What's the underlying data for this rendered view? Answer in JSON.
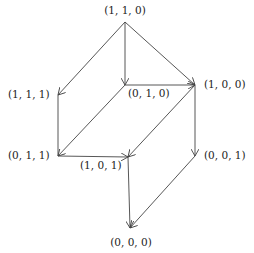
{
  "diagram": {
    "title": "",
    "nodes": [
      {
        "id": "n110",
        "label": "(1, 1, 0)",
        "x": 125,
        "y": 22,
        "lx": 125,
        "ly": 14,
        "anchor": "middle"
      },
      {
        "id": "n111",
        "label": "(1, 1, 1)",
        "x": 58,
        "y": 95,
        "lx": 8,
        "ly": 98,
        "anchor": "start"
      },
      {
        "id": "n010",
        "label": "(0, 1, 0)",
        "x": 125,
        "y": 85,
        "lx": 128,
        "ly": 97,
        "anchor": "start"
      },
      {
        "id": "n100",
        "label": "(1, 0, 0)",
        "x": 195,
        "y": 85,
        "lx": 204,
        "ly": 88,
        "anchor": "start"
      },
      {
        "id": "n011",
        "label": "(0, 1, 1)",
        "x": 58,
        "y": 156,
        "lx": 8,
        "ly": 159,
        "anchor": "start"
      },
      {
        "id": "n101",
        "label": "(1, 0, 1)",
        "x": 128,
        "y": 157,
        "lx": 80,
        "ly": 169,
        "anchor": "start"
      },
      {
        "id": "n001",
        "label": "(0, 0, 1)",
        "x": 195,
        "y": 156,
        "lx": 204,
        "ly": 159,
        "anchor": "start"
      },
      {
        "id": "n000",
        "label": "(0, 0, 0)",
        "x": 130,
        "y": 228,
        "lx": 131,
        "ly": 246,
        "anchor": "middle"
      }
    ],
    "edges": [
      {
        "from": "n110",
        "to": "n111",
        "arrow": true
      },
      {
        "from": "n110",
        "to": "n010",
        "arrow": true
      },
      {
        "from": "n110",
        "to": "n100",
        "arrow": true
      },
      {
        "from": "n010",
        "to": "n100",
        "arrow": true
      },
      {
        "from": "n111",
        "to": "n011",
        "arrow": false
      },
      {
        "from": "n010",
        "to": "n011",
        "arrow": true
      },
      {
        "from": "n011",
        "to": "n101",
        "arrow": true
      },
      {
        "from": "n100",
        "to": "n101",
        "arrow": true
      },
      {
        "from": "n100",
        "to": "n001",
        "arrow": true
      },
      {
        "from": "n101",
        "to": "n000",
        "arrow": true
      },
      {
        "from": "n001",
        "to": "n000",
        "arrow": true
      }
    ]
  }
}
